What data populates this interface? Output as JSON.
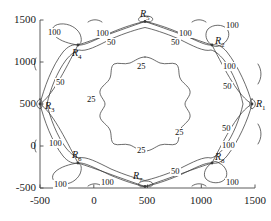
{
  "chart_data": {
    "type": "line",
    "title": "",
    "xlabel": "",
    "ylabel": "",
    "xlim": [
      -750,
      1600
    ],
    "ylim": [
      -620,
      1620
    ],
    "grid": false,
    "legend": null,
    "xticks": [
      -500,
      0,
      500,
      1000,
      1500
    ],
    "xtick_labels": [
      "-500",
      "0",
      "500",
      "1000",
      "1500"
    ],
    "yticks": [
      -500,
      0,
      500,
      1000,
      1500
    ],
    "ytick_labels": [
      "-500",
      "0",
      "500",
      "1000",
      "1500"
    ],
    "contour_levels": [
      100,
      50,
      25
    ],
    "nodes": [
      {
        "name": "R1",
        "x": 1500,
        "y": 500
      },
      {
        "name": "R2",
        "x": 1210,
        "y": 1210
      },
      {
        "name": "R3",
        "x": -500,
        "y": 500
      },
      {
        "name": "R4",
        "x": -210,
        "y": 1210
      },
      {
        "name": "R5",
        "x": 500,
        "y": 1500
      },
      {
        "name": "R6",
        "x": -210,
        "y": -210
      },
      {
        "name": "R7",
        "x": 500,
        "y": -500
      },
      {
        "name": "R8",
        "x": 1210,
        "y": -210
      }
    ],
    "contour_labels": [
      {
        "value": "100",
        "x": -420,
        "y": 1420
      },
      {
        "value": "100",
        "x": -30,
        "y": 1400
      },
      {
        "value": "50",
        "x": 110,
        "y": 1320
      },
      {
        "value": "100",
        "x": 930,
        "y": 1400
      },
      {
        "value": "50",
        "x": 790,
        "y": 1320
      },
      {
        "value": "100",
        "x": 1420,
        "y": 1430
      },
      {
        "value": "100",
        "x": 1340,
        "y": 1010
      },
      {
        "value": "50",
        "x": 1280,
        "y": 790
      },
      {
        "value": "50",
        "x": 1280,
        "y": 280
      },
      {
        "value": "100",
        "x": 1340,
        "y": 60
      },
      {
        "value": "100",
        "x": 1420,
        "y": -400
      },
      {
        "value": "50",
        "x": 790,
        "y": -390
      },
      {
        "value": "100",
        "x": 110,
        "y": -420
      },
      {
        "value": "100",
        "x": -420,
        "y": -440
      },
      {
        "value": "100",
        "x": -400,
        "y": 20
      },
      {
        "value": "50",
        "x": -330,
        "y": 790
      },
      {
        "value": "25",
        "x": 520,
        "y": 1020
      },
      {
        "value": "25",
        "x": -60,
        "y": 560
      },
      {
        "value": "25",
        "x": 1000,
        "y": 90
      },
      {
        "value": "25",
        "x": 520,
        "y": -30
      }
    ]
  }
}
